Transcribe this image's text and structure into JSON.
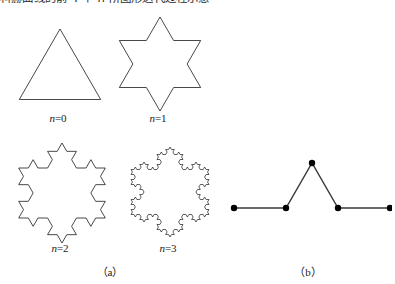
{
  "page": {
    "width": 395,
    "height": 284,
    "background": "#ffffff",
    "ink": "#1a1a1a",
    "header_text": "科赫曲线的前 4 个 n 阶图形迭代过程示意"
  },
  "figure": {
    "panels": [
      {
        "id": "a",
        "caption": "（a）",
        "center_x": 110,
        "caption_y": 266
      },
      {
        "id": "b",
        "caption": "（b）",
        "center_x": 308,
        "caption_y": 266
      }
    ]
  },
  "koch_snowflakes": [
    {
      "name": "koch-n0",
      "iteration": 0,
      "label_prefix": "n",
      "label_equals": "=",
      "label_value": "0",
      "box": {
        "x": 8,
        "y": 14,
        "w": 100,
        "h": 96
      },
      "label_box": {
        "x": 8,
        "y": 112,
        "w": 100
      },
      "stroke": "#1a1a1a",
      "stroke_width": 0.8,
      "orientation_deg": -90,
      "radius": 47,
      "center": {
        "x": 52,
        "y": 62
      }
    },
    {
      "name": "koch-n1",
      "iteration": 1,
      "label_prefix": "n",
      "label_equals": "=",
      "label_value": "1",
      "box": {
        "x": 108,
        "y": 14,
        "w": 100,
        "h": 96
      },
      "label_box": {
        "x": 108,
        "y": 112,
        "w": 100
      },
      "stroke": "#1a1a1a",
      "stroke_width": 0.8,
      "orientation_deg": -90,
      "radius": 47,
      "center": {
        "x": 52,
        "y": 50
      }
    },
    {
      "name": "koch-n2",
      "iteration": 2,
      "label_prefix": "n",
      "label_equals": "=",
      "label_value": "2",
      "box": {
        "x": 6,
        "y": 140,
        "w": 108,
        "h": 100
      },
      "label_box": {
        "x": 6,
        "y": 242,
        "w": 108
      },
      "stroke": "#1a1a1a",
      "stroke_width": 0.8,
      "orientation_deg": -90,
      "radius": 50,
      "center": {
        "x": 56,
        "y": 53
      }
    },
    {
      "name": "koch-n3",
      "iteration": 3,
      "label_prefix": "n",
      "label_equals": "=",
      "label_value": "3",
      "box": {
        "x": 120,
        "y": 142,
        "w": 96,
        "h": 98
      },
      "label_box": {
        "x": 120,
        "y": 242,
        "w": 96
      },
      "stroke": "#1a1a1a",
      "stroke_width": 0.7,
      "orientation_deg": -90,
      "radius": 45,
      "center": {
        "x": 50,
        "y": 50
      }
    }
  ],
  "generator": {
    "name": "koch-generator",
    "box": {
      "x": 224,
      "y": 152,
      "w": 168,
      "h": 70
    },
    "stroke": "#3a3a3a",
    "stroke_width": 1.4,
    "dot_color": "#000000",
    "dot_radius": 3.2,
    "points": [
      {
        "x": 10,
        "y": 56,
        "name": "vertex-start"
      },
      {
        "x": 62,
        "y": 56,
        "name": "vertex-left-inner"
      },
      {
        "x": 88,
        "y": 11,
        "name": "vertex-apex"
      },
      {
        "x": 114,
        "y": 56,
        "name": "vertex-right-inner"
      },
      {
        "x": 166,
        "y": 56,
        "name": "vertex-end"
      }
    ]
  }
}
